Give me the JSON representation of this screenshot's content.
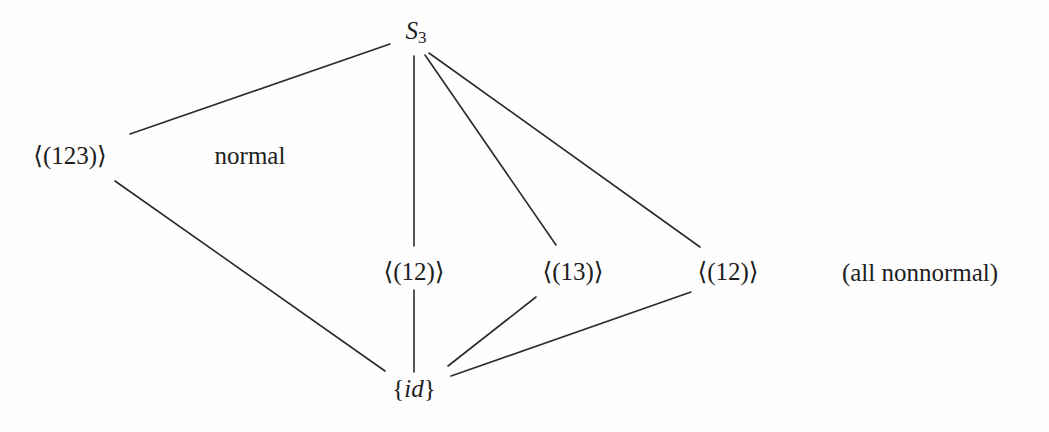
{
  "diagram": {
    "background_color": "#fefefe",
    "line_color": "#2a2a2a",
    "text_color": "#1d1d1d",
    "nodes": {
      "top": {
        "label_prefix": "S",
        "label_subscript": "3",
        "x": 416,
        "y": 32
      },
      "left": {
        "label": "⟨(123)⟩",
        "x": 70,
        "y": 155
      },
      "middle_left": {
        "label": "⟨(12)⟩",
        "x": 414,
        "y": 271
      },
      "middle_center": {
        "label": "⟨(13)⟩",
        "x": 573,
        "y": 271
      },
      "middle_right": {
        "label": "⟨(12)⟩",
        "x": 728,
        "y": 271
      },
      "bottom": {
        "label_open": "{",
        "label_var": "id",
        "label_close": "}",
        "x": 414,
        "y": 388
      }
    },
    "annotations": [
      {
        "name": "normal-label",
        "text": "normal",
        "x": 250,
        "y": 155
      },
      {
        "name": "nonnormal-label",
        "text": "(all nonnormal)",
        "x": 920,
        "y": 272
      }
    ],
    "edges": [
      {
        "name": "edge-top-to-left",
        "x1": 390,
        "y1": 44,
        "x2": 130,
        "y2": 134
      },
      {
        "name": "edge-top-to-middle-left",
        "x1": 414,
        "y1": 56,
        "x2": 414,
        "y2": 246
      },
      {
        "name": "edge-top-to-middle-center",
        "x1": 425,
        "y1": 55,
        "x2": 556,
        "y2": 245
      },
      {
        "name": "edge-top-to-middle-right",
        "x1": 429,
        "y1": 53,
        "x2": 700,
        "y2": 247
      },
      {
        "name": "edge-left-to-bottom",
        "x1": 115,
        "y1": 181,
        "x2": 385,
        "y2": 371
      },
      {
        "name": "edge-middle-left-to-bottom",
        "x1": 414,
        "y1": 290,
        "x2": 414,
        "y2": 372
      },
      {
        "name": "edge-middle-center-to-bottom",
        "x1": 536,
        "y1": 297,
        "x2": 448,
        "y2": 366
      },
      {
        "name": "edge-middle-right-to-bottom",
        "x1": 691,
        "y1": 292,
        "x2": 451,
        "y2": 376
      }
    ]
  }
}
